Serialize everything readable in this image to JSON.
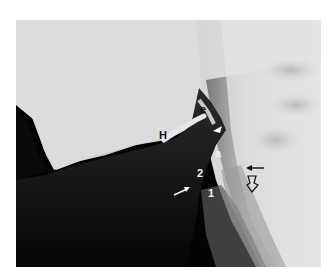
{
  "figure": {
    "type": "lateral radiograph (neck / pharynx)",
    "labels": [
      {
        "id": "e",
        "text": "e",
        "color": "black"
      },
      {
        "id": "H",
        "text": "H",
        "color": "black"
      },
      {
        "id": "a",
        "text": "a",
        "color": "white"
      },
      {
        "id": "2",
        "text": "2",
        "color": "white"
      },
      {
        "id": "1",
        "text": "1",
        "color": "white"
      }
    ],
    "markers": [
      {
        "id": "arrowhead",
        "kind": "white-arrowhead"
      },
      {
        "id": "arrow-white",
        "kind": "white-arrow"
      },
      {
        "id": "arrow-black",
        "kind": "black-arrow"
      },
      {
        "id": "arrow-open",
        "kind": "open-arrow"
      }
    ]
  }
}
